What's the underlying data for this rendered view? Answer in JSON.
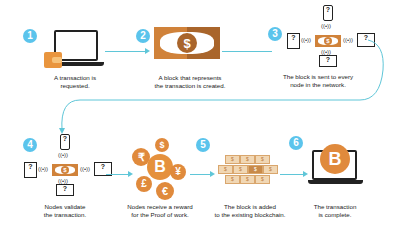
{
  "colors": {
    "step_badge": "#5bc4ec",
    "connector": "#5fc6d8",
    "bill_orange": "#d0823a",
    "bill_brown": "#a9652b",
    "coin_orange": "#e08a3c",
    "outline": "#222222"
  },
  "steps": [
    {
      "number": "1",
      "caption_line1": "A transaction is",
      "caption_line2": "requested.",
      "icon": "laptop-with-wallet-icon"
    },
    {
      "number": "2",
      "caption_line1": "A block that represents",
      "caption_line2": "the transaction is created.",
      "icon": "dollar-bill-icon"
    },
    {
      "number": "3",
      "caption_line1": "The block is sent to every",
      "caption_line2": "node in the network.",
      "icon": "network-broadcast-icon"
    },
    {
      "number": "4",
      "caption_line1": "Nodes validate",
      "caption_line2": "the transaction.",
      "icon": "network-validate-icon"
    },
    {
      "number": "",
      "caption_line1": "Nodes receive a reward",
      "caption_line2": "for the Proof of work.",
      "icon": "currency-coins-icon"
    },
    {
      "number": "5",
      "caption_line1": "The block is added",
      "caption_line2": "to the existing blockchain.",
      "icon": "blockchain-icon"
    },
    {
      "number": "6",
      "caption_line1": "The transaction",
      "caption_line2": "is complete.",
      "icon": "laptop-bitcoin-icon"
    }
  ],
  "glyphs": {
    "dollar": "$",
    "question": "?",
    "bitcoin": "B",
    "rupee": "₹",
    "yen": "¥",
    "pound": "£",
    "euro": "€",
    "wifi": "((•))"
  }
}
